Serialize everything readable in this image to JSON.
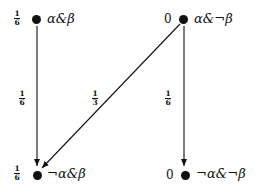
{
  "nodes": [
    {
      "id": "a_and_b",
      "label": "α&β",
      "prob_num": "1",
      "prob_den": "6",
      "prob": "1/6"
    },
    {
      "id": "a_and_notb",
      "label": "α&¬β",
      "prob": "0"
    },
    {
      "id": "nota_and_b",
      "label": "¬α&β",
      "prob_num": "1",
      "prob_den": "6",
      "prob": "1/6"
    },
    {
      "id": "nota_and_notb",
      "label": "¬α&¬β",
      "prob": "0"
    }
  ],
  "edges": [
    {
      "from": "a_and_b",
      "to": "nota_and_b",
      "weight_num": "1",
      "weight_den": "6",
      "weight": "1/6"
    },
    {
      "from": "a_and_notb",
      "to": "nota_and_b",
      "weight_num": "1",
      "weight_den": "3",
      "weight": "1/3"
    },
    {
      "from": "a_and_notb",
      "to": "nota_and_notb",
      "weight_num": "1",
      "weight_den": "6",
      "weight": "1/6"
    }
  ],
  "colors": {
    "ink": "#111111",
    "background": "#ffffff"
  }
}
